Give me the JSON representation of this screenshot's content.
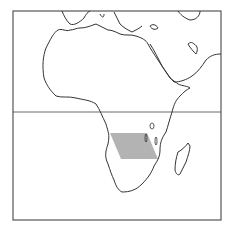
{
  "map": {
    "title": "",
    "region": "Africa, southern Europe and Middle East",
    "highlight": {
      "description": "shaded parallelogram region in south-central Africa",
      "color": "#b3b3b3",
      "points": [
        [
          110,
          133
        ],
        [
          147,
          133
        ],
        [
          158,
          159
        ],
        [
          121,
          159
        ]
      ]
    },
    "equator": {
      "y": 112
    },
    "colors": {
      "background": "#ffffff",
      "outline": "#333333",
      "frame": "#555555",
      "highlight": "#b3b3b3"
    }
  }
}
